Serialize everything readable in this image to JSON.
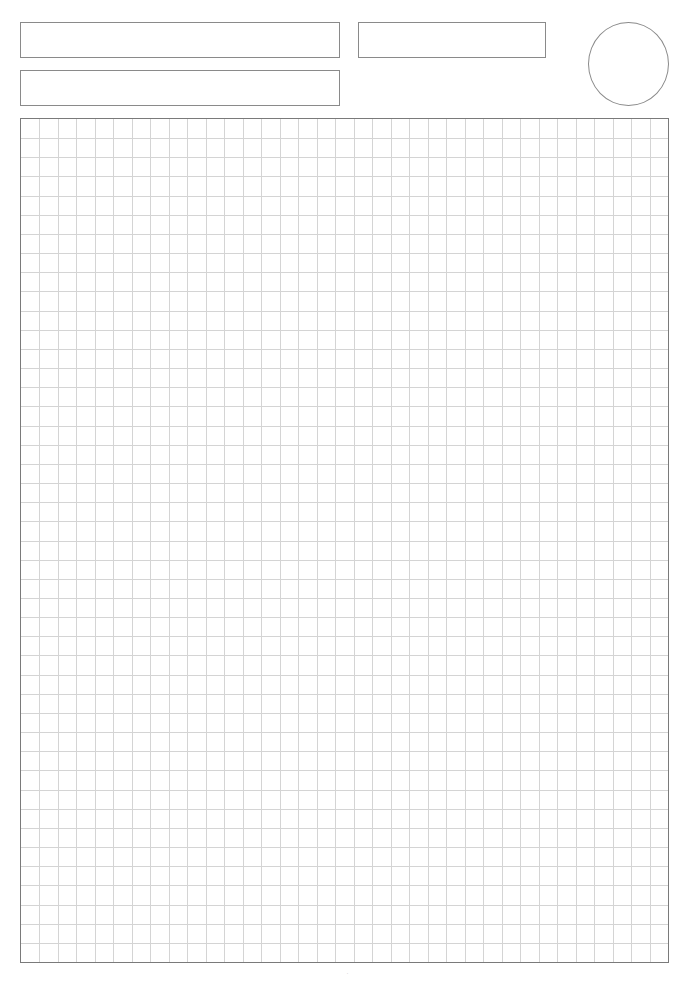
{
  "page": {
    "type": "grid-paper-template",
    "background_color": "#ffffff",
    "line_color": "#8a8a8a",
    "grid_line_color": "#d4d4d4",
    "border_color": "#7a7a7a"
  },
  "header": {
    "fields": [
      {
        "id": "field-1",
        "value": "",
        "x": 20,
        "y": 22,
        "width": 320,
        "height": 36
      },
      {
        "id": "field-2",
        "value": "",
        "x": 20,
        "y": 70,
        "width": 320,
        "height": 36
      },
      {
        "id": "field-3",
        "value": "",
        "x": 358,
        "y": 22,
        "width": 188,
        "height": 36
      }
    ],
    "circle": {
      "x": 588,
      "y": 22,
      "width": 81,
      "height": 84
    }
  },
  "grid": {
    "x": 20,
    "y": 118,
    "width": 649,
    "height": 845,
    "columns": 35,
    "rows": 44
  },
  "footer": {
    "page_marker": "·"
  }
}
